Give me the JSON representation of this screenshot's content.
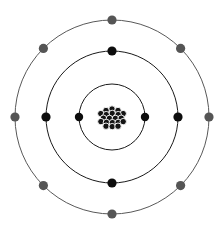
{
  "diagram": {
    "canvas": {
      "width": 223,
      "height": 234,
      "background": "#ffffff"
    },
    "center": {
      "x": 112,
      "y": 117
    },
    "nucleus": {
      "name": "nucleus",
      "particle_count": 17,
      "particle_radius": 3.2,
      "fill": "#141414",
      "outline": "#ffffff",
      "particles": [
        {
          "x": 112.0,
          "y": 109.0
        },
        {
          "x": 106.0,
          "y": 110.5
        },
        {
          "x": 118.0,
          "y": 110.5
        },
        {
          "x": 100.8,
          "y": 113.6
        },
        {
          "x": 112.2,
          "y": 113.4
        },
        {
          "x": 123.2,
          "y": 113.6
        },
        {
          "x": 106.2,
          "y": 114.6
        },
        {
          "x": 118.2,
          "y": 114.6
        },
        {
          "x": 103.4,
          "y": 118.2
        },
        {
          "x": 109.4,
          "y": 118.4
        },
        {
          "x": 115.4,
          "y": 118.4
        },
        {
          "x": 121.2,
          "y": 118.2
        },
        {
          "x": 100.9,
          "y": 121.6
        },
        {
          "x": 106.4,
          "y": 122.4
        },
        {
          "x": 112.4,
          "y": 122.6
        },
        {
          "x": 118.2,
          "y": 122.4
        },
        {
          "x": 123.2,
          "y": 121.6
        },
        {
          "x": 106.0,
          "y": 126.2
        },
        {
          "x": 112.2,
          "y": 126.6
        },
        {
          "x": 118.0,
          "y": 126.2
        }
      ]
    },
    "shells": [
      {
        "name": "shell-1",
        "label": "K shell",
        "radius": 33,
        "stroke": "#1a1a1a",
        "stroke_width": 1.0,
        "electron_count": 2,
        "electron_radius": 4.2,
        "electron_color": "#0d0d0d",
        "electrons": [
          {
            "angle_deg": 180,
            "x": 79.0,
            "y": 117.0
          },
          {
            "angle_deg": 0,
            "x": 145.0,
            "y": 117.0
          }
        ]
      },
      {
        "name": "shell-2",
        "label": "L shell",
        "radius": 66,
        "stroke": "#1a1a1a",
        "stroke_width": 1.0,
        "electron_count": 4,
        "electron_radius": 4.6,
        "electron_color": "#0d0d0d",
        "electrons": [
          {
            "angle_deg": 90,
            "x": 112.0,
            "y": 51.0
          },
          {
            "angle_deg": 180,
            "x": 46.0,
            "y": 117.0
          },
          {
            "angle_deg": 270,
            "x": 112.0,
            "y": 183.0
          },
          {
            "angle_deg": 0,
            "x": 178.0,
            "y": 117.0
          }
        ]
      },
      {
        "name": "shell-3",
        "label": "M shell",
        "radius": 97,
        "stroke": "#595959",
        "stroke_width": 1.0,
        "electron_count": 8,
        "electron_radius": 4.6,
        "electron_color": "#555555",
        "electrons": [
          {
            "angle_deg": 90,
            "x": 112.0,
            "y": 20.0
          },
          {
            "angle_deg": 135,
            "x": 43.4,
            "y": 48.4
          },
          {
            "angle_deg": 180,
            "x": 15.0,
            "y": 117.0
          },
          {
            "angle_deg": 225,
            "x": 43.4,
            "y": 185.6
          },
          {
            "angle_deg": 270,
            "x": 112.0,
            "y": 214.0
          },
          {
            "angle_deg": 315,
            "x": 180.6,
            "y": 185.6
          },
          {
            "angle_deg": 0,
            "x": 209.0,
            "y": 117.0
          },
          {
            "angle_deg": 45,
            "x": 180.6,
            "y": 48.4
          }
        ]
      }
    ],
    "colors": {
      "inner_electron": "#0d0d0d",
      "outer_electron": "#555555",
      "inner_ring": "#1a1a1a",
      "outer_ring": "#595959",
      "nucleus_fill": "#141414",
      "background": "#ffffff"
    }
  }
}
